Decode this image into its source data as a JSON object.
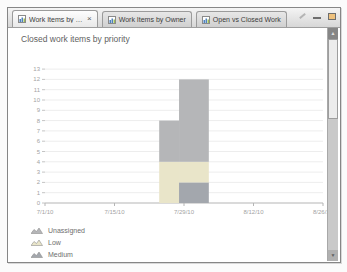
{
  "window": {
    "close_glyph": "×",
    "tabs": [
      {
        "label": "Work Items by Priority",
        "active": true,
        "closable": true
      },
      {
        "label": "Work Items by Owner",
        "active": false
      },
      {
        "label": "Open vs Closed Work",
        "active": false
      }
    ]
  },
  "chart_data": {
    "type": "area",
    "stacked": true,
    "title": "Closed work items by priority",
    "grid": true,
    "ylim": [
      0,
      13
    ],
    "y_ticks": [
      0,
      1,
      2,
      3,
      4,
      5,
      6,
      7,
      8,
      9,
      10,
      11,
      12,
      13
    ],
    "x_domain_days": [
      0,
      57
    ],
    "x_ticks": [
      {
        "label": "7/1/10",
        "day": 0
      },
      {
        "label": "7/15/10",
        "day": 14
      },
      {
        "label": "7/29/10",
        "day": 28
      },
      {
        "label": "8/12/10",
        "day": 42
      },
      {
        "label": "8/26/10",
        "day": 56
      }
    ],
    "series": [
      {
        "name": "Unassigned",
        "color": "#b5b6b8"
      },
      {
        "name": "Low",
        "color": "#e9e5c9"
      },
      {
        "name": "Medium",
        "color": "#a3a7ad"
      }
    ],
    "series_order_bottom_to_top": [
      "Medium",
      "Low",
      "Unassigned"
    ],
    "columns": [
      {
        "from_day": 23,
        "to_day": 27,
        "values": {
          "Medium": 0,
          "Low": 4,
          "Unassigned": 4
        }
      },
      {
        "from_day": 27,
        "to_day": 33,
        "values": {
          "Medium": 2,
          "Low": 2,
          "Unassigned": 8
        }
      }
    ],
    "legend": {
      "position": "bottom-left",
      "entries": [
        "Unassigned",
        "Low",
        "Medium"
      ]
    }
  }
}
